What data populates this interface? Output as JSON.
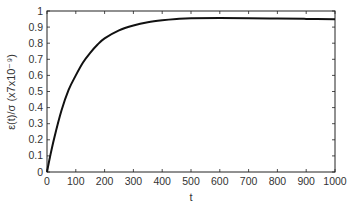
{
  "chart_data": {
    "type": "line",
    "title": "",
    "xlabel": "t",
    "ylabel": "ε(t)/σ (x7x10⁻⁹)",
    "xlim": [
      0,
      1000
    ],
    "ylim": [
      0,
      1
    ],
    "xticks": [
      0,
      100,
      200,
      300,
      400,
      500,
      600,
      700,
      800,
      900,
      1000
    ],
    "yticks": [
      0,
      0.1,
      0.2,
      0.3,
      0.4,
      0.5,
      0.6,
      0.7,
      0.8,
      0.9,
      1
    ],
    "xtick_labels": [
      "0",
      "100",
      "200",
      "300",
      "400",
      "500",
      "600",
      "700",
      "800",
      "900",
      "1000"
    ],
    "ytick_labels": [
      "0",
      "0.1",
      "0.2",
      "0.3",
      "0.4",
      "0.5",
      "0.6",
      "0.7",
      "0.8",
      "0.9",
      "1"
    ],
    "grid": false,
    "legend": null,
    "series": [
      {
        "name": "ε(t)/σ",
        "color": "#111111",
        "x": [
          0,
          10,
          25,
          50,
          75,
          100,
          125,
          150,
          175,
          200,
          250,
          300,
          350,
          400,
          450,
          500,
          600,
          700,
          800,
          900,
          1000
        ],
        "y": [
          0,
          0.09,
          0.21,
          0.38,
          0.51,
          0.6,
          0.68,
          0.74,
          0.79,
          0.83,
          0.88,
          0.91,
          0.93,
          0.942,
          0.95,
          0.955,
          0.956,
          0.955,
          0.953,
          0.951,
          0.949
        ]
      }
    ]
  }
}
